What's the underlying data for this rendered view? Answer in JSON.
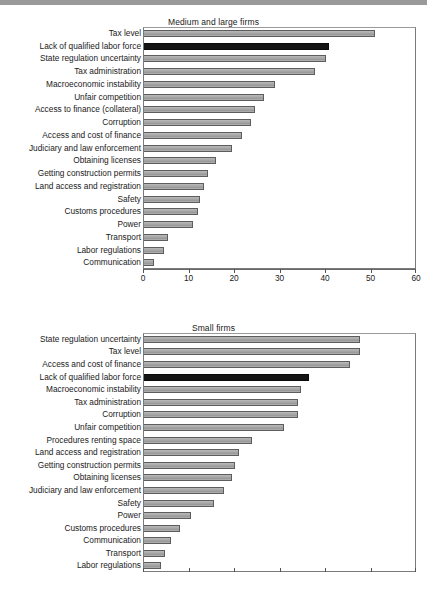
{
  "chart_data": [
    {
      "type": "bar",
      "orientation": "horizontal",
      "title": "Medium and large firms",
      "xlabel": "",
      "ylabel": "",
      "xlim": [
        0,
        60
      ],
      "xticks": [
        0,
        10,
        20,
        30,
        40,
        50,
        60
      ],
      "xtick_labels": [
        "0",
        "10",
        "20",
        "30",
        "40",
        "50",
        "60"
      ],
      "grid": false,
      "legend": "none",
      "highlight_category": "Lack of qualified labor force",
      "highlight_color": "#141414",
      "bar_color": "#a8a8a8",
      "categories": [
        "Tax level",
        "Lack of qualified labor force",
        "State regulation uncertainty",
        "Tax administration",
        "Macroeconomic instability",
        "Unfair competition",
        "Access to finance (collateral)",
        "Corruption",
        "Access and cost of finance",
        "Judiciary and law enforcement",
        "Obtaining licenses",
        "Getting construction permits",
        "Land access and registration",
        "Safety",
        "Customs procedures",
        "Power",
        "Transport",
        "Labor regulations",
        "Communication"
      ],
      "values": [
        51.0,
        40.8,
        40.3,
        37.9,
        29.0,
        26.6,
        24.6,
        23.8,
        21.8,
        19.6,
        16.0,
        14.3,
        13.3,
        12.6,
        12.0,
        11.0,
        5.6,
        4.7,
        2.4
      ]
    },
    {
      "type": "bar",
      "orientation": "horizontal",
      "title": "Small firms",
      "xlabel": "",
      "ylabel": "",
      "xlim": [
        0,
        60
      ],
      "xticks": [
        0,
        10,
        20,
        30,
        40,
        50,
        60
      ],
      "xtick_labels": [
        "",
        "",
        "",
        "",
        "",
        "",
        ""
      ],
      "grid": false,
      "legend": "none",
      "highlight_category": "Lack of qualified labor force",
      "highlight_color": "#141414",
      "bar_color": "#a8a8a8",
      "categories": [
        "State regulation uncertainty",
        "Tax level",
        "Access and cost of finance",
        "Lack of qualified labor force",
        "Macroeconomic instability",
        "Tax administration",
        "Corruption",
        "Unfair competition",
        "Procedures renting space",
        "Land access and registration",
        "Getting construction permits",
        "Obtaining licenses",
        "Judiciary and law enforcement",
        "Safety",
        "Power",
        "Customs procedures",
        "Communication",
        "Transport",
        "Labor regulations"
      ],
      "values": [
        47.8,
        47.6,
        45.6,
        36.4,
        34.8,
        34.1,
        34.1,
        31.0,
        24.0,
        21.2,
        20.3,
        19.6,
        17.8,
        15.6,
        10.6,
        8.2,
        6.2,
        4.8,
        4.0
      ]
    }
  ]
}
